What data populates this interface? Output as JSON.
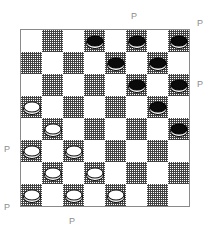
{
  "board": {
    "rows": 8,
    "cols": 8,
    "light_square_color": "#ffffff",
    "dark_square_color": "#3c3c3c",
    "border_color": "#8a8a8a",
    "dark_square_parity": "odd",
    "black_piece_color": "#0a0a0a",
    "white_piece_color": "#ffffff",
    "piece_outline_color": "#111111",
    "pieces": [
      {
        "row": 0,
        "col": 3,
        "color": "black"
      },
      {
        "row": 0,
        "col": 5,
        "color": "black"
      },
      {
        "row": 0,
        "col": 7,
        "color": "black"
      },
      {
        "row": 1,
        "col": 4,
        "color": "black"
      },
      {
        "row": 1,
        "col": 6,
        "color": "black"
      },
      {
        "row": 2,
        "col": 5,
        "color": "black"
      },
      {
        "row": 2,
        "col": 7,
        "color": "black"
      },
      {
        "row": 3,
        "col": 0,
        "color": "white"
      },
      {
        "row": 3,
        "col": 6,
        "color": "black"
      },
      {
        "row": 4,
        "col": 1,
        "color": "white"
      },
      {
        "row": 4,
        "col": 7,
        "color": "black"
      },
      {
        "row": 5,
        "col": 0,
        "color": "white"
      },
      {
        "row": 5,
        "col": 2,
        "color": "white"
      },
      {
        "row": 6,
        "col": 1,
        "color": "white"
      },
      {
        "row": 6,
        "col": 3,
        "color": "white"
      },
      {
        "row": 7,
        "col": 0,
        "color": "white"
      },
      {
        "row": 7,
        "col": 2,
        "color": "white"
      },
      {
        "row": 7,
        "col": 4,
        "color": "white"
      }
    ]
  },
  "labels": {
    "color": "#8c8c8c",
    "items": [
      {
        "id": "top-center",
        "text": "P",
        "x": 131,
        "y": 12
      },
      {
        "id": "top-right",
        "text": "P",
        "x": 197,
        "y": 19
      },
      {
        "id": "right-upper",
        "text": "P",
        "x": 197,
        "y": 80
      },
      {
        "id": "left-middle",
        "text": "P",
        "x": 4,
        "y": 145
      },
      {
        "id": "left-bottom",
        "text": "P",
        "x": 4,
        "y": 203
      },
      {
        "id": "bottom",
        "text": "P",
        "x": 69,
        "y": 217
      }
    ]
  }
}
